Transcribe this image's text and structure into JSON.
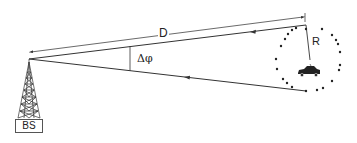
{
  "diagram": {
    "labels": {
      "distance": "D",
      "angle_spread": "Δφ",
      "radius": "R",
      "base_station": "BS"
    },
    "elements": {
      "base_station": "lattice-tower-icon",
      "mobile": "car-icon",
      "scatterer_ring": "dotted-circle"
    },
    "colors": {
      "line": "#333333",
      "background": "#ffffff"
    }
  }
}
